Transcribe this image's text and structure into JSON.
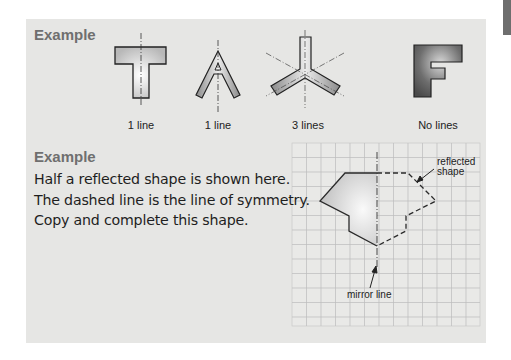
{
  "section1": {
    "heading": "Example",
    "shapes": [
      {
        "letter": "T",
        "label": "1 line"
      },
      {
        "letter": "A",
        "label": "1 line"
      },
      {
        "letter": "three-arm",
        "label": "3 lines"
      },
      {
        "letter": "F",
        "label": "No lines"
      }
    ]
  },
  "section2": {
    "heading": "Example",
    "lines": [
      "Half a reflected shape is shown here.",
      "The dashed line is the line of symmetry.",
      "Copy and complete this shape."
    ],
    "annotations": {
      "reflected": [
        "reflected",
        "shape"
      ],
      "mirror": "mirror line"
    }
  },
  "colors": {
    "panel": "#e6e6e4",
    "heading": "#6f6f6f",
    "grid": "#b9b9b9",
    "tab": "#6e6e6e"
  }
}
